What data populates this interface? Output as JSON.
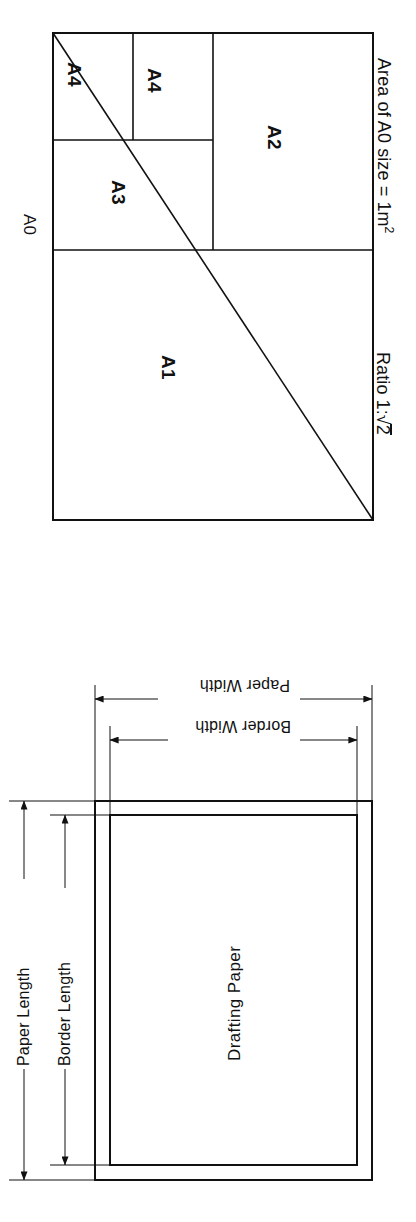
{
  "page": {
    "background": "#ffffff",
    "ink_color": "#111111",
    "orientation_note": "sideways"
  },
  "figure_a_series": {
    "name": "A-series paper subdivision diagram",
    "outer_label": "A0",
    "cells": [
      {
        "label": "A1"
      },
      {
        "label": "A2"
      },
      {
        "label": "A3"
      },
      {
        "label": "A4"
      },
      {
        "label": "A4"
      }
    ],
    "captions": {
      "ratio": "Ratio 1:",
      "ratio_radicand": "2",
      "area_prefix": "Area of A0 size = 1m",
      "area_exponent": "2"
    }
  },
  "figure_drafting_sheet": {
    "name": "Drafting sheet border diagram",
    "sheet_label": "Drafting Paper",
    "dimensions": [
      {
        "label": "Paper Width"
      },
      {
        "label": "Border Width"
      },
      {
        "label": "Paper Length"
      },
      {
        "label": "Border Length"
      }
    ]
  }
}
